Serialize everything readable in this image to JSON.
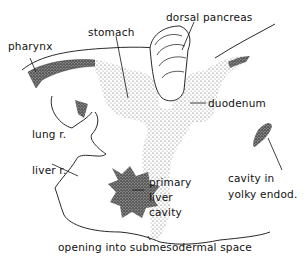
{
  "figure": {
    "type": "embryology-diagram",
    "colors": {
      "ink": "#111111",
      "stipple_light": "#9a9a9a",
      "stipple_dark": "#3a3a3a",
      "background": "#ffffff"
    }
  },
  "labels": {
    "pharynx": "pharynx",
    "stomach": "stomach",
    "dorsal_pancreas": "dorsal pancreas",
    "duodenum": "duodenum",
    "lung_r": "lung r.",
    "liver_r": "liver r.",
    "primary_liver_cavity": [
      "primary",
      "liver",
      "cavity"
    ],
    "cavity_in_yolky_endod": [
      "cavity in",
      "yolky endod."
    ],
    "opening": "opening into submesodermal space"
  }
}
